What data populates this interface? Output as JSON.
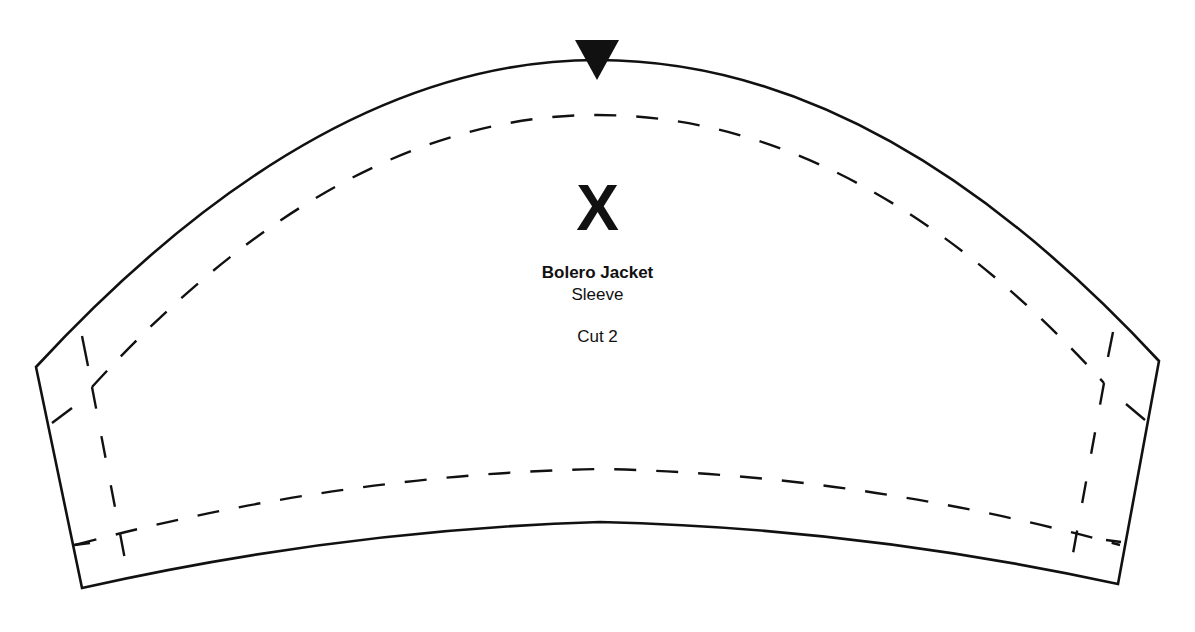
{
  "pattern": {
    "marker": "X",
    "title": "Bolero Jacket",
    "piece": "Sleeve",
    "cut_instruction": "Cut 2"
  },
  "colors": {
    "line": "#111111",
    "background": "#ffffff"
  },
  "notch": {
    "type": "triangle-down",
    "position": "top-center"
  }
}
